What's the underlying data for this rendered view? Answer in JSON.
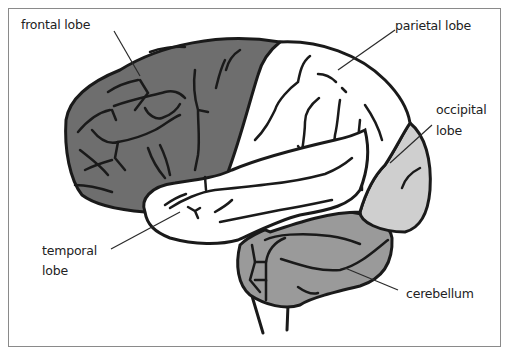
{
  "diagram": {
    "colors": {
      "frontal": "#6e6e6e",
      "parietal": "#ffffff",
      "temporal": "#ffffff",
      "occipital": "#cfcfcf",
      "cerebellum": "#9a9a9a",
      "outline": "#1a1a1a",
      "frame": "#8a8a8a"
    },
    "labels": {
      "frontal": "frontal lobe",
      "parietal": "parietal lobe",
      "occipital_line1": "occipital",
      "occipital_line2": "lobe",
      "temporal_line1": "temporal",
      "temporal_line2": "lobe",
      "cerebellum": "cerebellum"
    }
  }
}
